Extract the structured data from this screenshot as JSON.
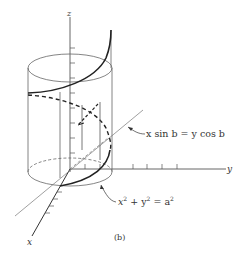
{
  "figure": {
    "caption": "(b)",
    "axes": {
      "x_label": "x",
      "y_label": "y",
      "z_label": "z"
    },
    "annotations": {
      "plane_equation": "x sin b = y cos b",
      "cylinder_equation_lhs": "x",
      "cylinder_equation_mid1": " + y",
      "cylinder_equation_mid2": " = a",
      "exponent": "2"
    },
    "colors": {
      "line": "#222222",
      "thin_line": "#666666",
      "background": "#ffffff"
    }
  }
}
